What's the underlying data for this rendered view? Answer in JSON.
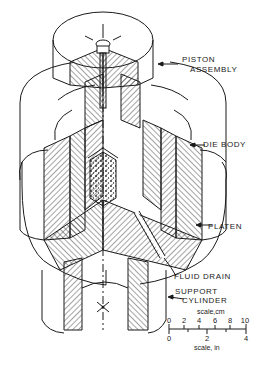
{
  "figure": {
    "type": "cutaway isometric diagram"
  },
  "labels": {
    "piston_line1": "PISTON",
    "piston_line2": "ASSEMBLY",
    "die_body": "DIE BODY",
    "platen": "PLATEN",
    "fluid_drain": "FLUID DRAIN",
    "support_line1": "SUPPORT",
    "support_line2": "CYLINDER"
  },
  "scale": {
    "cm_label": "scale,cm",
    "in_label": "scale, in",
    "cm_ticks": [
      "0",
      "2",
      "4",
      "6",
      "8",
      "10"
    ],
    "in_ticks": [
      "0",
      "2",
      "4"
    ]
  },
  "colors": {
    "ink": "#1a1a1a",
    "background": "#ffffff"
  }
}
